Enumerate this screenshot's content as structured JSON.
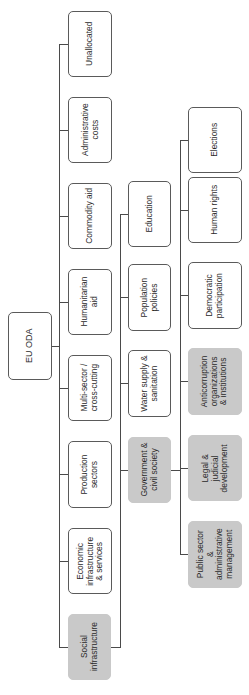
{
  "diagram": {
    "title": "EU ODA",
    "orientation": "rotated -90deg (root at left, text reads bottom-to-top)",
    "colors": {
      "shaded_fill": "#c9c9c9",
      "border": "#5a5a5a",
      "line": "#4a4a4a",
      "text": "#2a2a2a"
    },
    "root": {
      "label": "EU ODA"
    },
    "level1": [
      {
        "label": "Unallocated",
        "shaded": false
      },
      {
        "label": "Administrative\ncosts",
        "shaded": false
      },
      {
        "label": "Commodity aid",
        "shaded": false
      },
      {
        "label": "Humanitarian\naid",
        "shaded": false
      },
      {
        "label": "Multi-sector /\ncross-cutting",
        "shaded": false
      },
      {
        "label": "Production\nsectors",
        "shaded": false
      },
      {
        "label": "Economic\ninfrastructure\n& services",
        "shaded": false
      },
      {
        "label": "Social\ninfrastructure",
        "shaded": true
      }
    ],
    "level2": {
      "parent": "Social infrastructure",
      "items": [
        {
          "label": "Education",
          "shaded": false
        },
        {
          "label": "Population\npolicies",
          "shaded": false
        },
        {
          "label": "Water supply &\nsanitation",
          "shaded": false
        },
        {
          "label": "Government &\ncivil society",
          "shaded": true
        }
      ]
    },
    "level3": {
      "parent": "Government & civil society",
      "items": [
        {
          "label": "Elections",
          "shaded": false
        },
        {
          "label": "Human rights",
          "shaded": false
        },
        {
          "label": "Democratic\nparticipation",
          "shaded": false
        },
        {
          "label": "Anticorruption\norganizations\n& institutions",
          "shaded": true
        },
        {
          "label": "Legal &\njudicial\ndevelopment",
          "shaded": true
        },
        {
          "label": "Public sector\n&\nadministrative\nmanagement",
          "shaded": true
        }
      ]
    }
  }
}
